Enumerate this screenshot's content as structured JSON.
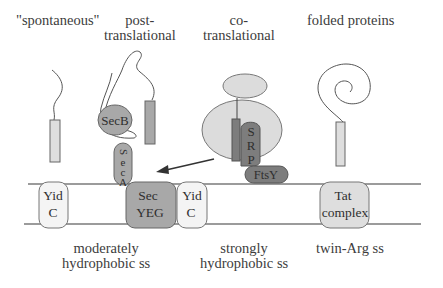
{
  "colors": {
    "background": "#ffffff",
    "line": "#555555",
    "membrane": "#7a7a7a",
    "light_fill": "#dedede",
    "mid_fill": "#a8a8a8",
    "dark_fill": "#7d7d7d",
    "ribosome_fill": "#dcdcdc",
    "yidc_fill": "#f4f4f4"
  },
  "top_labels": {
    "spontaneous": "\"spontaneous\"",
    "post_line1": "post-",
    "post_line2": "translational",
    "co_line1": "co-",
    "co_line2": "translational",
    "folded": "folded proteins"
  },
  "components": {
    "secb": "SecB",
    "seca": [
      "S",
      "e",
      "c",
      "A"
    ],
    "srp": [
      "S",
      "R",
      "P"
    ],
    "ftsy": "FtsY",
    "yidc_left": [
      "Yid",
      "C"
    ],
    "secyeg": [
      "Sec",
      "YEG"
    ],
    "yidc_right": [
      "Yid",
      "C"
    ],
    "tat": [
      "Tat",
      "complex"
    ]
  },
  "bottom_labels": {
    "moderate_line1": "moderately",
    "moderate_line2": "hydrophobic ss",
    "strong_line1": "strongly",
    "strong_line2": "hydrophobic ss",
    "twinarg": "twin-Arg ss"
  }
}
